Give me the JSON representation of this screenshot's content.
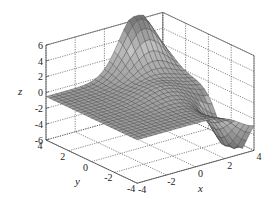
{
  "chart_data": {
    "type": "surface3d",
    "title": "",
    "xlabel": "x",
    "ylabel": "y",
    "zlabel": "z",
    "xlim": [
      -4,
      4
    ],
    "ylim": [
      -4,
      4
    ],
    "zlim": [
      -6,
      6
    ],
    "x_ticks": [
      "-4",
      "-2",
      "0",
      "2",
      "4"
    ],
    "y_ticks": [
      "-4",
      "-2",
      "0",
      "2",
      "4"
    ],
    "z_ticks": [
      "-6",
      "-4",
      "-2",
      "0",
      "2",
      "4",
      "6"
    ],
    "grid": true,
    "grid_style": "dotted",
    "colormap": "gray",
    "mesh_size": 25,
    "features": {
      "peak": {
        "approx_x": 2,
        "approx_y": 4,
        "z": 6
      },
      "trough": {
        "approx_x": 4,
        "approx_y": -2,
        "z": -6
      },
      "flat_regions": "z≈0 near x=-4 and far corners"
    }
  },
  "axes": {
    "x_label": "x",
    "y_label": "y",
    "z_label": "z"
  }
}
